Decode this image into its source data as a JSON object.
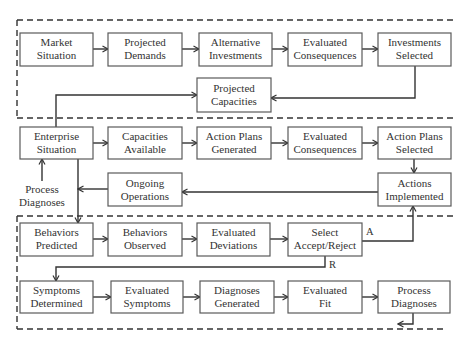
{
  "nodes": {
    "market_situation": {
      "line1": "Market",
      "line2": "Situation"
    },
    "projected_demands": {
      "line1": "Projected",
      "line2": "Demands"
    },
    "alternative_investments": {
      "line1": "Alternative",
      "line2": "Investments"
    },
    "evaluated_consequences_top": {
      "line1": "Evaluated",
      "line2": "Consequences"
    },
    "investments_selected": {
      "line1": "Investments",
      "line2": "Selected"
    },
    "projected_capacities": {
      "line1": "Projected",
      "line2": "Capacities"
    },
    "enterprise_situation": {
      "line1": "Enterprise",
      "line2": "Situation"
    },
    "capacities_available": {
      "line1": "Capacities",
      "line2": "Available"
    },
    "action_plans_generated": {
      "line1": "Action Plans",
      "line2": "Generated"
    },
    "evaluated_consequences_mid": {
      "line1": "Evaluated",
      "line2": "Consequences"
    },
    "action_plans_selected": {
      "line1": "Action Plans",
      "line2": "Selected"
    },
    "ongoing_operations": {
      "line1": "Ongoing",
      "line2": "Operations"
    },
    "actions_implemented": {
      "line1": "Actions",
      "line2": "Implemented"
    },
    "behaviors_predicted": {
      "line1": "Behaviors",
      "line2": "Predicted"
    },
    "behaviors_observed": {
      "line1": "Behaviors",
      "line2": "Observed"
    },
    "evaluated_deviations": {
      "line1": "Evaluated",
      "line2": "Deviations"
    },
    "select_accept_reject": {
      "line1": "Select",
      "line2": "Accept/Reject"
    },
    "symptoms_determined": {
      "line1": "Symptoms",
      "line2": "Determined"
    },
    "evaluated_symptoms": {
      "line1": "Evaluated",
      "line2": "Symptoms"
    },
    "diagnoses_generated": {
      "line1": "Diagnoses",
      "line2": "Generated"
    },
    "evaluated_fit": {
      "line1": "Evaluated",
      "line2": "Fit"
    },
    "process_diagnoses": {
      "line1": "Process",
      "line2": "Diagnoses"
    }
  },
  "free_labels": {
    "process_diagnoses_input": {
      "line1": "Process",
      "line2": "Diagnoses"
    }
  },
  "edge_labels": {
    "accept": "A",
    "reject": "R"
  },
  "colors": {
    "box_stroke": "#5a5a5a",
    "line": "#333333",
    "text": "#333333",
    "background": "#ffffff"
  }
}
